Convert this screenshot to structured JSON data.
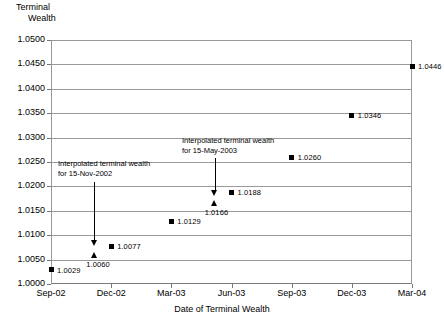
{
  "chart_data": {
    "type": "scatter",
    "title": "",
    "ylabel": "Terminal Wealth",
    "ylabel_line1": "Terminal",
    "ylabel_line2": "Wealth",
    "xlabel": "Date of Terminal Wealth",
    "ylim": [
      1.0,
      1.05
    ],
    "ytick_labels": [
      "1.0500",
      "1.0450",
      "1.0400",
      "1.0350",
      "1.0300",
      "1.0250",
      "1.0200",
      "1.0150",
      "1.0100",
      "1.0050",
      "1.0000"
    ],
    "ytick_values": [
      1.05,
      1.045,
      1.04,
      1.035,
      1.03,
      1.025,
      1.02,
      1.015,
      1.01,
      1.005,
      1.0
    ],
    "xtick_labels": [
      "Sep-02",
      "Dec-02",
      "Mar-03",
      "Jun-03",
      "Sep-03",
      "Dec-03",
      "Mar-04"
    ],
    "grid": true,
    "legend": "none",
    "series": [
      {
        "name": "Terminal wealth (observed)",
        "marker": "square",
        "points": [
          {
            "x_label": "Sep-02",
            "x_index": 0.0,
            "y": 1.0029,
            "label": "1.0029"
          },
          {
            "x_label": "Dec-02",
            "x_index": 1.0,
            "y": 1.0077,
            "label": "1.0077"
          },
          {
            "x_label": "Mar-03",
            "x_index": 2.0,
            "y": 1.0129,
            "label": "1.0129"
          },
          {
            "x_label": "Jun-03",
            "x_index": 3.0,
            "y": 1.0188,
            "label": "1.0188"
          },
          {
            "x_label": "Sep-03",
            "x_index": 4.0,
            "y": 1.026,
            "label": "1.0260"
          },
          {
            "x_label": "Dec-03",
            "x_index": 5.0,
            "y": 1.0346,
            "label": "1.0346"
          },
          {
            "x_label": "Mar-04",
            "x_index": 6.0,
            "y": 1.0446,
            "label": "1.0446"
          }
        ]
      },
      {
        "name": "Interpolated terminal wealth",
        "marker": "triangle",
        "points": [
          {
            "x_label": "15-Nov-2002",
            "x_index": 0.72,
            "y": 1.006,
            "label": "1.0060"
          },
          {
            "x_label": "15-May-2003",
            "x_index": 2.72,
            "y": 1.0166,
            "label": "1.0166"
          }
        ]
      }
    ],
    "annotations": [
      {
        "id": "annot-nov-2002",
        "line1": "Interpolated terminal wealth",
        "line2": "for 15-Nov-2002",
        "target_x_index": 0.72,
        "target_y": 1.006
      },
      {
        "id": "annot-may-2003",
        "line1": "Interpolated terminal wealth",
        "line2": "for 15-May-2003",
        "target_x_index": 2.72,
        "target_y": 1.0166
      }
    ]
  },
  "colors": {
    "marker": "#000000",
    "grid": "#9a9a9a",
    "axis": "#777777",
    "background": "#ffffff"
  }
}
